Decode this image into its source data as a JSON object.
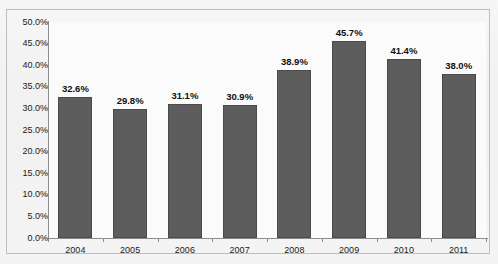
{
  "chart_data": {
    "type": "bar",
    "title": "",
    "subtitle": "",
    "xlabel": "",
    "ylabel": "",
    "categories": [
      "2004",
      "2005",
      "2006",
      "2007",
      "2008",
      "2009",
      "2010",
      "2011"
    ],
    "values": [
      32.6,
      29.8,
      31.1,
      30.9,
      38.9,
      45.7,
      41.4,
      38.0
    ],
    "data_labels": [
      "32.6%",
      "29.8%",
      "31.1%",
      "30.9%",
      "38.9%",
      "45.7%",
      "41.4%",
      "38.0%"
    ],
    "ylim": [
      0,
      50
    ],
    "y_tick_step": 5,
    "y_tick_labels": [
      "50.0%",
      "45.0%",
      "40.0%",
      "35.0%",
      "30.0%",
      "25.0%",
      "20.0%",
      "15.0%",
      "10.0%",
      "5.0%",
      "0.0%"
    ],
    "y_tick_values": [
      50,
      45,
      40,
      35,
      30,
      25,
      20,
      15,
      10,
      5,
      0
    ],
    "grid": false,
    "legend": false,
    "legend_position": "none",
    "series": [
      {
        "name": "",
        "values": [
          32.6,
          29.8,
          31.1,
          30.9,
          38.9,
          45.7,
          41.4,
          38.0
        ]
      }
    ],
    "annotations": []
  },
  "style": {
    "bar_color": "#5d5d5d",
    "bar_border_color": "#4a4a4a",
    "axis_color": "#8c8c8c",
    "frame_color": "#bdbdbd",
    "plot_background": "#fbfbfb",
    "page_background": "#f4f4f4",
    "text_color": "#1a1a1a"
  }
}
